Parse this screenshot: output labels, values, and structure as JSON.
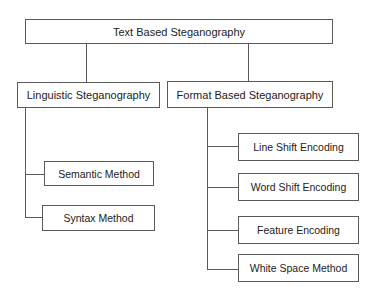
{
  "diagram": {
    "type": "tree",
    "root": {
      "label": "Text Based Steganography"
    },
    "branches": [
      {
        "label": "Linguistic Steganography",
        "children": [
          {
            "label": "Semantic Method"
          },
          {
            "label": "Syntax Method"
          }
        ]
      },
      {
        "label": "Format Based Steganography",
        "children": [
          {
            "label": "Line Shift Encoding"
          },
          {
            "label": "Word Shift Encoding"
          },
          {
            "label": "Feature Encoding"
          },
          {
            "label": "White Space Method"
          }
        ]
      }
    ],
    "colors": {
      "line": "#5a5a5a",
      "text": "#222222",
      "background": "#ffffff"
    }
  }
}
